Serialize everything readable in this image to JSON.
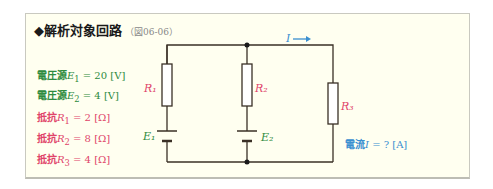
{
  "title": {
    "text": "◆解析対象回路",
    "ref": "（図06-06）"
  },
  "parameters": [
    {
      "label": "電圧源",
      "symbol": "E",
      "sub": "1",
      "eq": "= 20 [V]",
      "color": "#2e8b3e"
    },
    {
      "label": "電圧源",
      "symbol": "E",
      "sub": "2",
      "eq": "=  4 [V]",
      "color": "#2e8b3e"
    },
    {
      "label": "抵抗",
      "symbol": "R",
      "sub": "1",
      "eq": "=  2 [Ω]",
      "color": "#e0446a"
    },
    {
      "label": "抵抗",
      "symbol": "R",
      "sub": "2",
      "eq": "=  8 [Ω]",
      "color": "#e0446a"
    },
    {
      "label": "抵抗",
      "symbol": "R",
      "sub": "3",
      "eq": "=  4 [Ω]",
      "color": "#e0446a"
    }
  ],
  "circuit": {
    "labels": {
      "R1": "R₁",
      "R2": "R₂",
      "R3": "R₃",
      "E1": "E₁",
      "E2": "E₂",
      "current": "I"
    },
    "colors": {
      "wire": "#3a3026",
      "resistor_label": "#e0446a",
      "source_label": "#2e8b3e",
      "current": "#3a8fd0"
    }
  },
  "result": {
    "label": "電流",
    "symbol": "I",
    "eq": "= ? [A]"
  }
}
